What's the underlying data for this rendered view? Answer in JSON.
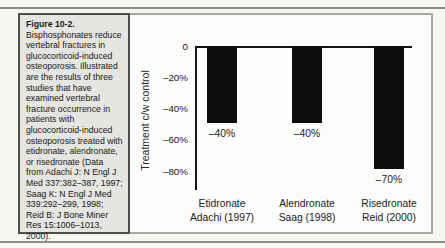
{
  "caption_panel": {
    "heading": "Figure 10-2.",
    "body": "Bisphosphonates reduce vertebral fractures in glucocorticoid-induced osteoporosis. Illustrated are the results of three studies that have examined vertebral fracture occurrence in patients with glucocorticoid-induced osteoporosis treated with etidronate, alendronate, or risedronate (Data from Adachi J: N Engl J Med 337:382–387, 1997; Saag K: N Engl J Med 339:292–299, 1998; Reid B: J Bone Miner Res 15:1006–1013, 2000)."
  },
  "chart_data": {
    "type": "bar",
    "title": "",
    "xlabel": "",
    "ylabel": "Treatment c/w control",
    "ylim": [
      0,
      -92
    ],
    "grid": false,
    "legend": "none",
    "bar_color": "#0c0c0c",
    "categories": [
      "Etidronate Adachi (1997)",
      "Alendronate Saag (1998)",
      "Risedronate Reid (2000)"
    ],
    "values": [
      -40,
      -40,
      -70
    ],
    "yticks": [
      {
        "value": 0,
        "label": "0"
      },
      {
        "value": -20,
        "label": "–20%"
      },
      {
        "value": -40,
        "label": "–40%"
      },
      {
        "value": -60,
        "label": "–60%"
      },
      {
        "value": -80,
        "label": "–80%"
      }
    ],
    "bars": [
      {
        "label_line1": "Etidronate",
        "label_line2": "Adachi (1997)",
        "value": -40,
        "value_label": "–40%",
        "drawn_value": -49
      },
      {
        "label_line1": "Alendronate",
        "label_line2": "Saag (1998)",
        "value": -40,
        "value_label": "–40%",
        "drawn_value": -49
      },
      {
        "label_line1": "Risedronate",
        "label_line2": "Reid (2000)",
        "value": -70,
        "value_label": "–70%",
        "drawn_value": -79
      }
    ]
  }
}
